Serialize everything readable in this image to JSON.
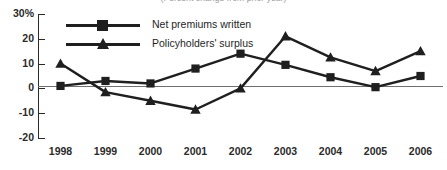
{
  "chart_data": {
    "type": "line",
    "title": "",
    "subtitle": "(Percent change from prior year)",
    "xlabel": "",
    "ylabel": "",
    "categories": [
      "1998",
      "1999",
      "2000",
      "2001",
      "2002",
      "2003",
      "2004",
      "2005",
      "2006"
    ],
    "ylim": [
      -20,
      30
    ],
    "yticks": [
      30,
      20,
      10,
      0,
      -10,
      -20
    ],
    "ytick_labels": [
      "30%",
      "20",
      "10",
      "0",
      "-10",
      "-20"
    ],
    "grid": false,
    "legend_position": "top-left",
    "zero_line": true,
    "series": [
      {
        "name": "Net premiums written",
        "marker": "square",
        "color": "#1f1f1f",
        "values": [
          1,
          3,
          2,
          8,
          14,
          9.5,
          4.5,
          0.5,
          5
        ]
      },
      {
        "name": "Policyholders' surplus",
        "marker": "triangle",
        "color": "#1f1f1f",
        "values": [
          10,
          -1.5,
          -5,
          -8.5,
          0,
          21,
          12.5,
          7,
          15
        ]
      }
    ]
  },
  "legend": {
    "items": [
      {
        "label": "Net premiums written",
        "marker": "square"
      },
      {
        "label": "Policyholders' surplus",
        "marker": "triangle"
      }
    ]
  },
  "colors": {
    "series": "#1f1f1f",
    "axis": "#2b2b2b",
    "zero_line": "#6f6f6f",
    "background": "#ffffff",
    "subtitle": "#9a9a9a"
  }
}
